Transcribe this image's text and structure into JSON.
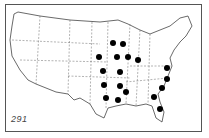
{
  "map": {
    "subject": "United States map with state outlines and marked locations",
    "figure_number": "291",
    "colors": {
      "background": "#ffffff",
      "outline": "#444444",
      "marker": "#000000"
    },
    "markers": [
      {
        "x": 113,
        "y": 43
      },
      {
        "x": 123,
        "y": 44
      },
      {
        "x": 99,
        "y": 57
      },
      {
        "x": 117,
        "y": 57
      },
      {
        "x": 128,
        "y": 57
      },
      {
        "x": 138,
        "y": 60
      },
      {
        "x": 103,
        "y": 71
      },
      {
        "x": 120,
        "y": 72
      },
      {
        "x": 167,
        "y": 68
      },
      {
        "x": 104,
        "y": 85
      },
      {
        "x": 120,
        "y": 86
      },
      {
        "x": 167,
        "y": 79
      },
      {
        "x": 126,
        "y": 92
      },
      {
        "x": 162,
        "y": 88
      },
      {
        "x": 106,
        "y": 98
      },
      {
        "x": 118,
        "y": 100
      },
      {
        "x": 154,
        "y": 97
      },
      {
        "x": 160,
        "y": 109
      }
    ]
  }
}
